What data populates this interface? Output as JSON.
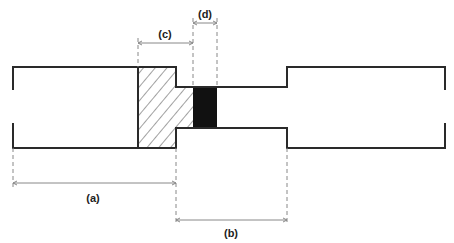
{
  "diagram": {
    "type": "stepped-bar cross-section with dimension annotations",
    "colors": {
      "outline": "#2a2a2a",
      "dimension": "#888888",
      "hatch": "#444444",
      "solid_fill": "#111111",
      "background": "#ffffff"
    },
    "regions": [
      {
        "id": "left-wide-section",
        "fill": "none"
      },
      {
        "id": "hatched-shoulder",
        "fill": "hatched"
      },
      {
        "id": "black-band",
        "fill": "solid"
      },
      {
        "id": "narrow-neck",
        "fill": "none"
      },
      {
        "id": "right-wide-section",
        "fill": "none"
      }
    ],
    "dimensions": [
      {
        "id": "a",
        "label": "(a)",
        "spans": "left end to start of narrow neck"
      },
      {
        "id": "b",
        "label": "(b)",
        "spans": "length of narrow neck"
      },
      {
        "id": "c",
        "label": "(c)",
        "spans": "hatched shoulder region"
      },
      {
        "id": "d",
        "label": "(d)",
        "spans": "black band"
      }
    ]
  }
}
